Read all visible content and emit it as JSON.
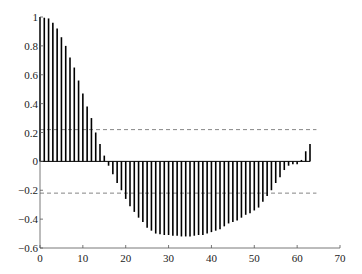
{
  "chart_data": {
    "type": "stem",
    "title": "",
    "xlabel": "",
    "ylabel": "",
    "xlim": [
      0,
      70
    ],
    "ylim": [
      -0.6,
      1
    ],
    "xticks": [
      0,
      10,
      20,
      30,
      40,
      50,
      60,
      70
    ],
    "yticks": [
      -0.6,
      -0.4,
      -0.2,
      0,
      0.2,
      0.4,
      0.6,
      0.8,
      1
    ],
    "ytick_labels": [
      "−0.6",
      "−0.4",
      "−0.2",
      "0",
      "0.2",
      "0.4",
      "0.6",
      "0.8",
      "1"
    ],
    "xtick_labels": [
      "0",
      "10",
      "20",
      "30",
      "40",
      "50",
      "60",
      "70"
    ],
    "grid": false,
    "legend": null,
    "confidence_bounds": [
      0.22,
      -0.22
    ],
    "x": [
      0,
      1,
      2,
      3,
      4,
      5,
      6,
      7,
      8,
      9,
      10,
      11,
      12,
      13,
      14,
      15,
      16,
      17,
      18,
      19,
      20,
      21,
      22,
      23,
      24,
      25,
      26,
      27,
      28,
      29,
      30,
      31,
      32,
      33,
      34,
      35,
      36,
      37,
      38,
      39,
      40,
      41,
      42,
      43,
      44,
      45,
      46,
      47,
      48,
      49,
      50,
      51,
      52,
      53,
      54,
      55,
      56,
      57,
      58,
      59,
      60,
      61,
      62,
      63
    ],
    "values": [
      1.0,
      0.995,
      0.99,
      0.96,
      0.92,
      0.86,
      0.8,
      0.72,
      0.65,
      0.56,
      0.47,
      0.38,
      0.3,
      0.2,
      0.12,
      0.04,
      -0.03,
      -0.09,
      -0.15,
      -0.2,
      -0.26,
      -0.31,
      -0.35,
      -0.39,
      -0.42,
      -0.46,
      -0.48,
      -0.5,
      -0.505,
      -0.51,
      -0.51,
      -0.515,
      -0.515,
      -0.52,
      -0.52,
      -0.52,
      -0.515,
      -0.51,
      -0.51,
      -0.5,
      -0.49,
      -0.48,
      -0.47,
      -0.45,
      -0.43,
      -0.42,
      -0.41,
      -0.39,
      -0.37,
      -0.36,
      -0.34,
      -0.32,
      -0.28,
      -0.24,
      -0.2,
      -0.15,
      -0.11,
      -0.06,
      -0.03,
      -0.02,
      -0.02,
      0.01,
      0.07,
      0.12
    ]
  },
  "style": {
    "stem_color": "#000000",
    "axis_color": "#555555",
    "bound_color": "#666666"
  }
}
